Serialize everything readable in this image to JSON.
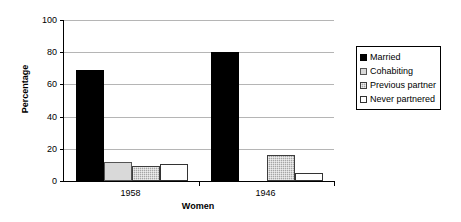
{
  "chart_data": {
    "type": "bar",
    "title": "",
    "xlabel": "Women",
    "ylabel": "Percentage",
    "categories": [
      "1958",
      "1946"
    ],
    "series": [
      {
        "name": "Married",
        "values": [
          69,
          80
        ],
        "swatch": "solid-black"
      },
      {
        "name": "Cohabiting",
        "values": [
          12,
          0
        ],
        "swatch": "light-gray"
      },
      {
        "name": "Previous partner",
        "values": [
          9.5,
          16
        ],
        "swatch": "gray-hatched"
      },
      {
        "name": "Never partnered",
        "values": [
          10.5,
          5
        ],
        "swatch": "white-outline"
      }
    ],
    "ylim": [
      0,
      100
    ],
    "yticks": [
      "0",
      "20",
      "40",
      "60",
      "80",
      "100"
    ],
    "ytick_values": [
      0,
      20,
      40,
      60,
      80,
      100
    ],
    "grid": true,
    "legend_position": "right"
  },
  "colors": {
    "married": "#000000",
    "cohabiting": "#d9d9d9",
    "previous_partner": "#a6a6a6",
    "never_partnered": "#ffffff",
    "gridline": "#b5b5b5",
    "axis": "#000000",
    "background": "#ffffff"
  }
}
